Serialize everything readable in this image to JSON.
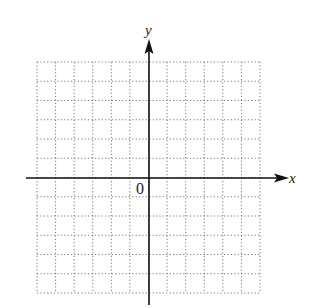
{
  "diagram": {
    "type": "coordinate-plane",
    "x_axis_label": "x",
    "y_axis_label": "y",
    "origin_label": "0",
    "grid": {
      "columns": 12,
      "rows": 12,
      "x_range": [
        -6,
        6
      ],
      "y_range": [
        -6,
        6
      ],
      "style": "dotted",
      "color": "#555555"
    },
    "axis_color": "#111111"
  }
}
